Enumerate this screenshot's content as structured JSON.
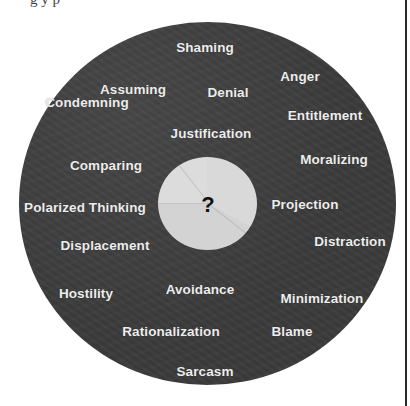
{
  "caption": {
    "text": "g        y                   p"
  },
  "diagram": {
    "center_symbol": "?",
    "colors": {
      "outer_disc": "#3b3b3b",
      "inner_disc": "#d9d9d9",
      "label_text": "#ededed",
      "center_symbol": "#111111",
      "right_border": "#2a2a2a"
    },
    "labels": [
      {
        "text": "Shaming",
        "x": 205,
        "y": 47
      },
      {
        "text": "Anger",
        "x": 300,
        "y": 76
      },
      {
        "text": "Assuming",
        "x": 133,
        "y": 89
      },
      {
        "text": "Denial",
        "x": 228,
        "y": 92
      },
      {
        "text": "Condemning",
        "x": 87,
        "y": 102
      },
      {
        "text": "Entitlement",
        "x": 325,
        "y": 115
      },
      {
        "text": "Justification",
        "x": 211,
        "y": 133
      },
      {
        "text": "Moralizing",
        "x": 334,
        "y": 159
      },
      {
        "text": "Comparing",
        "x": 106,
        "y": 165
      },
      {
        "text": "Projection",
        "x": 305,
        "y": 204
      },
      {
        "text": "Polarized Thinking",
        "x": 85,
        "y": 207
      },
      {
        "text": "Distraction",
        "x": 350,
        "y": 241
      },
      {
        "text": "Displacement",
        "x": 105,
        "y": 245
      },
      {
        "text": "Avoidance",
        "x": 200,
        "y": 289
      },
      {
        "text": "Hostility",
        "x": 86,
        "y": 293
      },
      {
        "text": "Minimization",
        "x": 322,
        "y": 298
      },
      {
        "text": "Rationalization",
        "x": 171,
        "y": 331
      },
      {
        "text": "Blame",
        "x": 292,
        "y": 331
      },
      {
        "text": "Sarcasm",
        "x": 205,
        "y": 371
      }
    ]
  }
}
